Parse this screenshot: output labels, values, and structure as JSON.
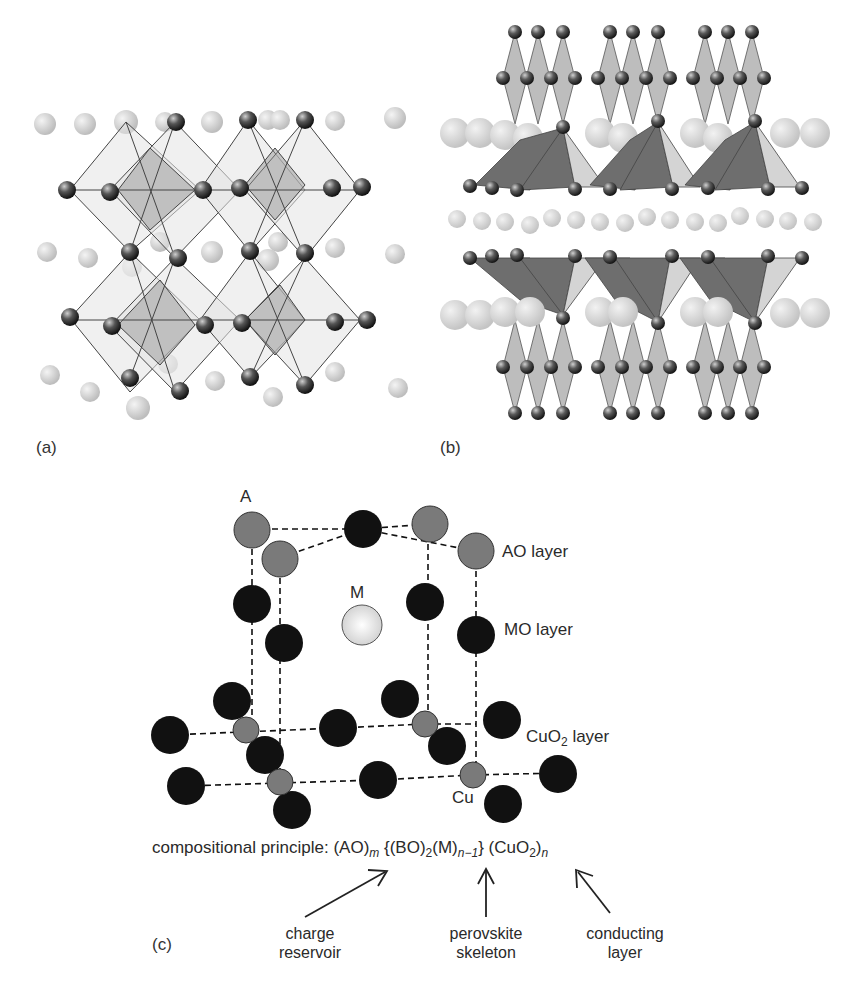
{
  "panels": {
    "a": {
      "label": "(a)",
      "description": "Perovskite crystal structure: corner-sharing octahedra with dark B/O spheres and light A-site spheres"
    },
    "b": {
      "label": "(b)",
      "description": "Layered cuprate structure: square pyramids, octahedral chains, and layers of large light spheres"
    },
    "c": {
      "label": "(c)",
      "atom_labels": {
        "A": "A",
        "M": "M",
        "Cu": "Cu"
      },
      "layer_labels": {
        "ao": "AO layer",
        "mo": "MO layer",
        "cuo2_main": "CuO",
        "cuo2_sub": "2",
        "cuo2_tail": " layer"
      },
      "formula": {
        "prefix": "compositional principle: ",
        "ao": "(AO)",
        "ao_sub": "m",
        "bo_open": " {(BO)",
        "bo_sub": "2",
        "m": "(M)",
        "m_sub": "n−1",
        "close": "} ",
        "cuo2": "(CuO",
        "cuo2_sub": "2",
        "cuo2_close": ")",
        "cuo2_outer_sub": "n"
      },
      "annotations": [
        {
          "line1": "charge",
          "line2": "reservoir"
        },
        {
          "line1": "perovskite",
          "line2": "skeleton"
        },
        {
          "line1": "conducting",
          "line2": "layer"
        }
      ]
    }
  },
  "colors": {
    "dark_atom": "#111111",
    "grey_atom": "#7a7a7a",
    "light_atom": "#d9d9d9",
    "polyhedron_dark": "#6e6e6e",
    "polyhedron_light": "#d4d4d4",
    "polyhedron_mid": "#bdbdbd"
  }
}
